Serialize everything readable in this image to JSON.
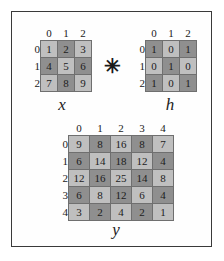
{
  "figure": {
    "operator": "✳",
    "operator_name": "convolution-operator",
    "border_color": "#3a3a3a",
    "background_color": "#ffffff",
    "cell_light_color": "#bfbfbf",
    "cell_dark_color": "#8f8f8f",
    "cell_border_color": "#6f6f6f"
  },
  "matrices": [
    {
      "id": "x",
      "label": "x",
      "col_headers": [
        "0",
        "1",
        "2"
      ],
      "row_headers": [
        "0",
        "1",
        "2"
      ],
      "rows": [
        [
          "1",
          "2",
          "3"
        ],
        [
          "4",
          "5",
          "6"
        ],
        [
          "7",
          "8",
          "9"
        ]
      ],
      "shades": [
        [
          "light",
          "dark",
          "light"
        ],
        [
          "dark",
          "light",
          "dark"
        ],
        [
          "light",
          "dark",
          "light"
        ]
      ]
    },
    {
      "id": "h",
      "label": "h",
      "col_headers": [
        "0",
        "1",
        "2"
      ],
      "row_headers": [
        "0",
        "1",
        "2"
      ],
      "rows": [
        [
          "1",
          "0",
          "1"
        ],
        [
          "0",
          "1",
          "0"
        ],
        [
          "1",
          "0",
          "1"
        ]
      ],
      "shades": [
        [
          "dark",
          "light",
          "dark"
        ],
        [
          "light",
          "dark",
          "light"
        ],
        [
          "dark",
          "light",
          "dark"
        ]
      ]
    },
    {
      "id": "y",
      "label": "y",
      "col_headers": [
        "0",
        "1",
        "2",
        "3",
        "4"
      ],
      "row_headers": [
        "0",
        "1",
        "2",
        "3",
        "4"
      ],
      "rows": [
        [
          "9",
          "8",
          "16",
          "8",
          "7"
        ],
        [
          "6",
          "14",
          "18",
          "12",
          "4"
        ],
        [
          "12",
          "16",
          "25",
          "14",
          "8"
        ],
        [
          "6",
          "8",
          "12",
          "6",
          "4"
        ],
        [
          "3",
          "2",
          "4",
          "2",
          "1"
        ]
      ],
      "shades": [
        [
          "light",
          "dark",
          "light",
          "dark",
          "light"
        ],
        [
          "dark",
          "light",
          "dark",
          "light",
          "dark"
        ],
        [
          "light",
          "dark",
          "light",
          "dark",
          "light"
        ],
        [
          "dark",
          "light",
          "dark",
          "light",
          "dark"
        ],
        [
          "light",
          "dark",
          "light",
          "dark",
          "light"
        ]
      ]
    }
  ]
}
